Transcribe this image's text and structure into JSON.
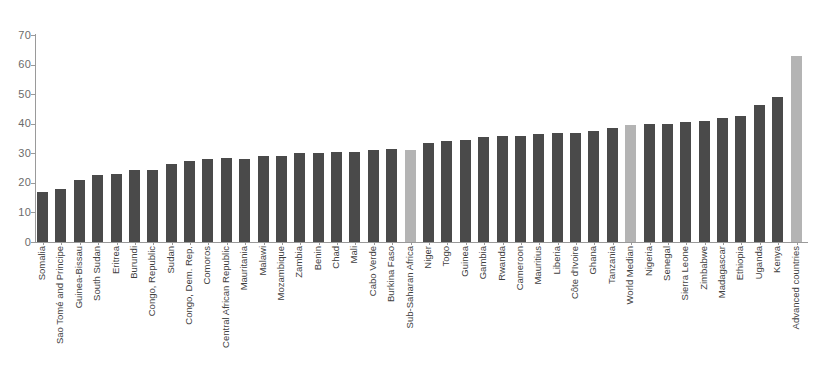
{
  "chart_data": {
    "type": "bar",
    "title": "",
    "subtitle": "",
    "xlabel": "",
    "ylabel": "",
    "ylim": [
      0,
      70
    ],
    "yticks": [
      0,
      10,
      20,
      30,
      40,
      50,
      60,
      70
    ],
    "ytick_labels": [
      "0",
      "10",
      "20",
      "30",
      "40",
      "50",
      "60",
      "70"
    ],
    "grid": false,
    "legend": "none",
    "bar_color": "#4a4a4a",
    "highlight_color": "#b4b4b4",
    "axis_color": "#9a9a9a",
    "categories": [
      "Somalia",
      "Sao Tomé and Principe",
      "Guinea-Bissau",
      "South Sudan",
      "Eritrea",
      "Burundi",
      "Congo, Republic",
      "Sudan",
      "Congo, Dem. Rep.",
      "Comoros",
      "Central African Republic",
      "Mauritania",
      "Malawi",
      "Mozambique",
      "Zambia",
      "Benin",
      "Chad",
      "Mali",
      "Cabo Verde",
      "Burkina Faso",
      "Sub-Saharan Africa",
      "Niger",
      "Togo",
      "Guinea",
      "Gambia",
      "Rwanda",
      "Cameroon",
      "Mauritius",
      "Liberia",
      "Côte d'Ivoire",
      "Ghana",
      "Tanzania",
      "World Median",
      "Nigeria",
      "Senegal",
      "Sierra Leone",
      "Zimbabwe",
      "Madagascar",
      "Ethiopia",
      "Uganda",
      "Kenya",
      "Advanced countries"
    ],
    "values": [
      17,
      18,
      21,
      22.5,
      23,
      24.5,
      24.5,
      26.5,
      27.5,
      28,
      28.5,
      28,
      29,
      29,
      30,
      30,
      30.5,
      30.5,
      31,
      31.5,
      31,
      33.5,
      34,
      34.5,
      35.5,
      36,
      36,
      36.5,
      37,
      37,
      37.5,
      38.5,
      39.5,
      40,
      40,
      40.5,
      41,
      42,
      42.5,
      46.5,
      49,
      63
    ],
    "highlighted": [
      "Sub-Saharan Africa",
      "World Median",
      "Advanced countries"
    ]
  }
}
